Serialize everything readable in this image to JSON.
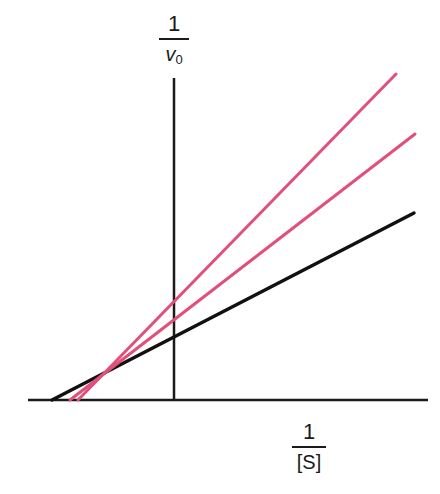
{
  "chart_data": {
    "type": "line",
    "title": "",
    "xlabel": "1/[S]",
    "ylabel": "1/v0",
    "x_axis_label": {
      "numerator": "1",
      "denominator": "[S]"
    },
    "y_axis_label": {
      "numerator": "1",
      "denominator_var": "v",
      "denominator_sub": "0"
    },
    "grid": false,
    "legend": null,
    "ticks": "none",
    "axes": {
      "x_axis": {
        "x1": 28,
        "x2": 428,
        "y": 400
      },
      "y_axis": {
        "x": 174,
        "y1": 78,
        "y2": 400
      }
    },
    "series": [
      {
        "name": "uninhibited",
        "color": "#111111",
        "points": [
          [
            52,
            400
          ],
          [
            414,
            213
          ]
        ],
        "y_intercept_px": 338
      },
      {
        "name": "inhibited-1",
        "color": "#e0507a",
        "points": [
          [
            70,
            400
          ],
          [
            415,
            134
          ]
        ],
        "y_intercept_px": 319
      },
      {
        "name": "inhibited-2",
        "color": "#e0507a",
        "points": [
          [
            78,
            400
          ],
          [
            396,
            74
          ]
        ],
        "y_intercept_px": 303
      }
    ],
    "intersection_point_px": [
      107,
      372
    ],
    "annotations": [
      "Lineweaver-Burk style double-reciprocal plot; lines intersect left of y-axis above x-axis (mixed inhibition)"
    ]
  }
}
